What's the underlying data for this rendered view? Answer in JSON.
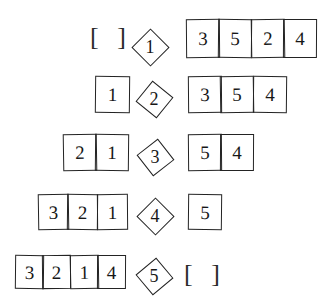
{
  "figure": {
    "kind": "hand-drawn-algorithm-trace",
    "ink_color": "#232323",
    "background_color": "#ffffff"
  },
  "empty_list_symbol": "[ ]",
  "rows": [
    {
      "step": "1",
      "left_label": "[ ]",
      "left_cells": [],
      "right_cells": [
        "3",
        "5",
        "2",
        "4"
      ]
    },
    {
      "step": "2",
      "left_label": "",
      "left_cells": [
        "1"
      ],
      "right_cells": [
        "3",
        "5",
        "4"
      ]
    },
    {
      "step": "3",
      "left_label": "",
      "left_cells": [
        "2",
        "1"
      ],
      "right_cells": [
        "5",
        "4"
      ]
    },
    {
      "step": "4",
      "left_label": "",
      "left_cells": [
        "3",
        "2",
        "1"
      ],
      "right_cells": [
        "5"
      ]
    },
    {
      "step": "5",
      "left_label": "",
      "left_cells": [
        "3",
        "2",
        "1",
        "4"
      ],
      "right_cells": [],
      "right_label": "[ ]"
    }
  ]
}
